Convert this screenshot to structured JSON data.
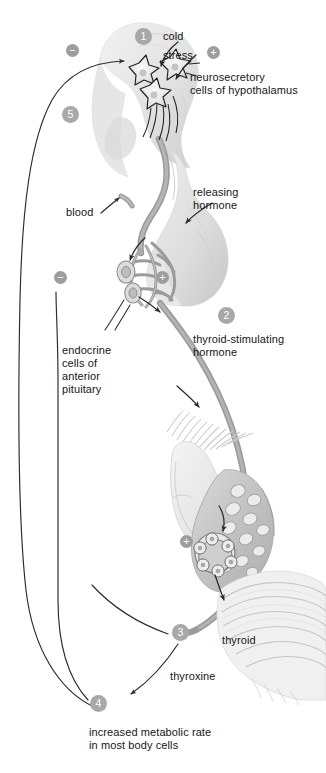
{
  "diagram": {
    "colors": {
      "badge_fill": "#a8a8a8",
      "badge_text": "#ffffff",
      "vessel": "#8f8f8f",
      "tissue_light": "#ededed",
      "tissue_mid": "#d8d8d8",
      "arrow": "#2a2a2a",
      "text": "#161616"
    },
    "steps": [
      {
        "id": "1",
        "label": "1",
        "name": "step-1-hypothalamus"
      },
      {
        "id": "2",
        "label": "2",
        "name": "step-2-tsh"
      },
      {
        "id": "3",
        "label": "3",
        "name": "step-3-thyroid-output"
      },
      {
        "id": "4",
        "label": "4",
        "name": "step-4-metabolic-rate"
      },
      {
        "id": "5",
        "label": "5",
        "name": "step-5-feedback"
      }
    ],
    "signs": [
      {
        "id": "minus-top",
        "label": "−"
      },
      {
        "id": "plus-stress",
        "label": "+"
      },
      {
        "id": "minus-pituitary",
        "label": "−"
      },
      {
        "id": "plus-pituitary",
        "label": "+"
      },
      {
        "id": "plus-thyroid",
        "label": "+"
      }
    ],
    "labels": {
      "cold": "cold",
      "stress": "stress",
      "neurosecretory_line1": "neurosecretory",
      "neurosecretory_line2": "cells of hypothalamus",
      "releasing_line1": "releasing",
      "releasing_line2": "hormone",
      "blood": "blood",
      "endocrine_line1": "endocrine",
      "endocrine_line2": "cells of",
      "endocrine_line3": "anterior",
      "endocrine_line4": "pituitary",
      "tsh_line1": "thyroid-stimulating",
      "tsh_line2": "hormone",
      "thyroid": "thyroid",
      "thyroxine": "thyroxine",
      "metabolic_line1": "increased metabolic rate",
      "metabolic_line2": "in most body cells"
    }
  }
}
